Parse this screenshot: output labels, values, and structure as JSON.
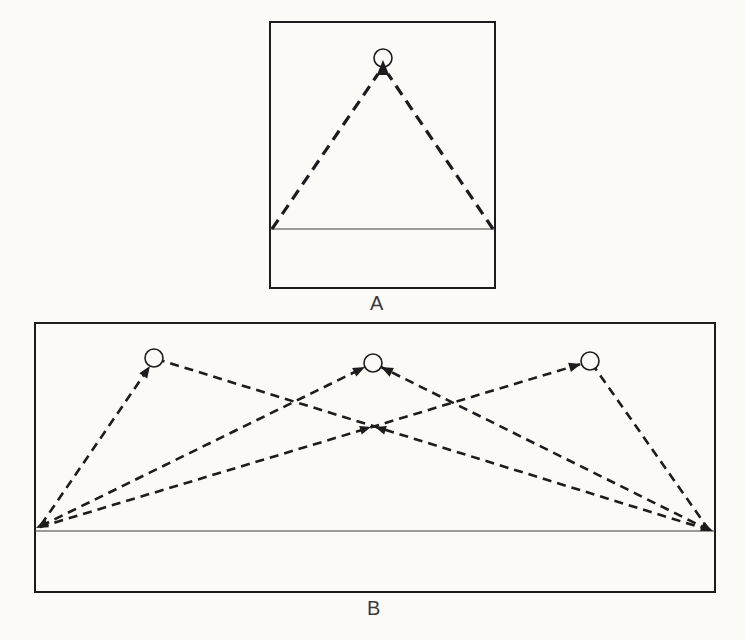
{
  "figure": {
    "background": "#fbfaf7",
    "ink": "#1c1c1c",
    "floor_ink": "#3c3c3c",
    "panels": [
      {
        "label": "A",
        "box": {
          "x": 270,
          "y": 22,
          "w": 225,
          "h": 266
        },
        "floor_line_y": 229,
        "label_pos": {
          "x": 377,
          "y": 303
        },
        "targets": [
          {
            "cx": 383,
            "cy": 58,
            "r": 9
          }
        ],
        "paths": [
          {
            "x1": 272,
            "y1": 229,
            "x2": 378,
            "y2": 74,
            "end_arrow": false
          },
          {
            "x1": 493,
            "y1": 229,
            "x2": 388,
            "y2": 74,
            "end_arrow": false
          }
        ],
        "free_arrows": [
          {
            "x": 383,
            "y": 60,
            "angle": -90,
            "len": 15,
            "hw": 6.2
          }
        ],
        "dash": {
          "width": 3.2,
          "array": "11 7"
        }
      },
      {
        "label": "B",
        "box": {
          "x": 35,
          "y": 323,
          "w": 680,
          "h": 269
        },
        "floor_line_y": 531,
        "label_pos": {
          "x": 374,
          "y": 608
        },
        "targets": [
          {
            "cx": 154,
            "cy": 358,
            "r": 9
          },
          {
            "cx": 373,
            "cy": 363,
            "r": 9
          },
          {
            "cx": 590,
            "cy": 361,
            "r": 9
          }
        ],
        "paths": [
          {
            "x1": 41,
            "y1": 525,
            "x2": 150,
            "y2": 366,
            "end_arrow": true
          },
          {
            "x1": 41,
            "y1": 526,
            "x2": 365,
            "y2": 367,
            "end_arrow": true
          },
          {
            "x1": 40,
            "y1": 527,
            "x2": 581,
            "y2": 364,
            "end_arrow": true,
            "mid_arrow": {
              "x": 371,
              "y": 427
            }
          },
          {
            "x1": 709,
            "y1": 530,
            "x2": 163,
            "y2": 361,
            "end_arrow": false,
            "mid_arrow": {
              "x": 375,
              "y": 427
            }
          },
          {
            "x1": 709,
            "y1": 530,
            "x2": 381,
            "y2": 367,
            "end_arrow": true
          },
          {
            "x1": 709,
            "y1": 530,
            "x2": 595,
            "y2": 368,
            "end_arrow": false
          }
        ],
        "free_arrows": [
          {
            "x": 36,
            "y": 528,
            "angle": 155,
            "len": 12,
            "hw": 4.8
          },
          {
            "x": 713,
            "y": 531,
            "angle": 22,
            "len": 12,
            "hw": 4.8
          }
        ],
        "dash": {
          "width": 2.6,
          "array": "9 6"
        }
      }
    ]
  }
}
